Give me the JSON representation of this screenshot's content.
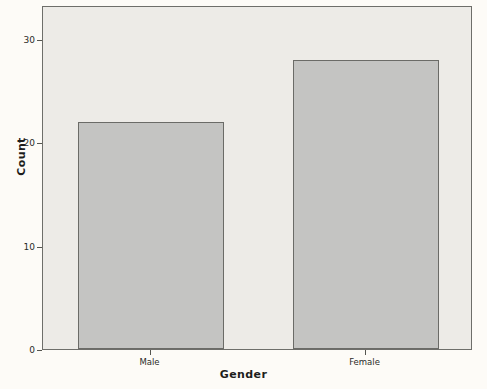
{
  "chart_data": {
    "type": "bar",
    "title": "",
    "subtitle": "",
    "categories": [
      "Male",
      "Female"
    ],
    "values": [
      22,
      28
    ],
    "xlabel": "Gender",
    "ylabel": "Count",
    "ylim": [
      0,
      33.3
    ],
    "ytick_values": [
      0,
      10,
      20,
      30
    ],
    "ytick_labels": [
      "0",
      "10",
      "20",
      "30"
    ],
    "grid": false,
    "legend": false,
    "legend_position": "none",
    "bar_fill_color": "#c4c4c2",
    "bar_border_color": "#6b6b67",
    "plot_background_color": "#edebe7",
    "page_background_color": "#fdfbf7",
    "axis_color": "#55554f"
  }
}
